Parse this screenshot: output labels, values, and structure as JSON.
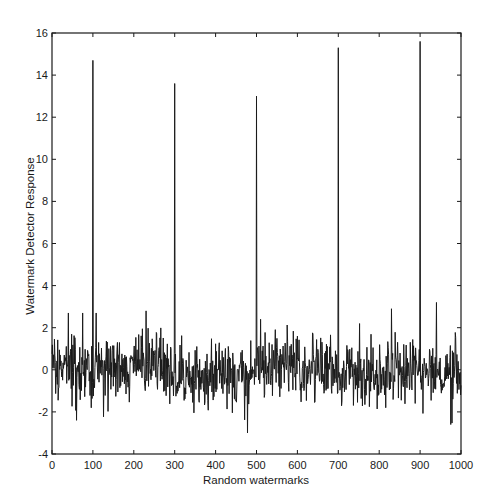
{
  "chart_data": {
    "type": "line",
    "title": "",
    "xlabel": "Random watermarks",
    "ylabel": "Watermark Detector Response",
    "xlim": [
      0,
      1000
    ],
    "ylim": [
      -4,
      16
    ],
    "xticks": [
      0,
      100,
      200,
      300,
      400,
      500,
      600,
      700,
      800,
      900,
      1000
    ],
    "yticks": [
      -4,
      -2,
      0,
      2,
      4,
      6,
      8,
      10,
      12,
      14,
      16
    ],
    "grid": false,
    "legend": null,
    "series": [
      {
        "name": "Detector response",
        "description": "Response to 1000 random watermarks; noise around 0 (approx. -3 to 3) with five sharp peaks at the embedded watermarks",
        "spikes": [
          {
            "x": 100,
            "y": 14.7
          },
          {
            "x": 300,
            "y": 13.6
          },
          {
            "x": 500,
            "y": 13.0
          },
          {
            "x": 700,
            "y": 15.3
          },
          {
            "x": 900,
            "y": 15.6
          }
        ],
        "noise": {
          "count": 1000,
          "mean": 0.0,
          "std": 0.85,
          "min": -3.0,
          "max": 3.2,
          "seed": 7
        },
        "notable_extremes": [
          {
            "x": 40,
            "y": 2.7
          },
          {
            "x": 60,
            "y": -2.4
          },
          {
            "x": 75,
            "y": 2.7
          },
          {
            "x": 108,
            "y": 2.7
          },
          {
            "x": 230,
            "y": 2.8
          },
          {
            "x": 478,
            "y": -3.0
          },
          {
            "x": 510,
            "y": 2.4
          },
          {
            "x": 830,
            "y": 2.9
          },
          {
            "x": 940,
            "y": 3.2
          },
          {
            "x": 975,
            "y": -2.6
          }
        ]
      }
    ],
    "color": "#1a1a1a"
  }
}
